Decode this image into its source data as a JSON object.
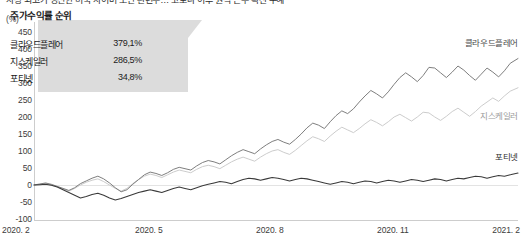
{
  "headline": {
    "text": "사상 최고가 경신한 미국 사이버 보안 관련주… 코로나 이후 원격 근무 확산 수혜"
  },
  "axis": {
    "unit_label": "(%)",
    "y_ticks": [
      450,
      400,
      350,
      300,
      250,
      200,
      150,
      100,
      50,
      0,
      -50,
      -100
    ],
    "x_ticks": [
      "2020. 2",
      "2020. 5",
      "2020. 8",
      "2020. 11",
      "2021. 2"
    ]
  },
  "callout": {
    "title": "주가수익률 순위",
    "rows": [
      {
        "name": "클라우드플레어",
        "value": "379,1%"
      },
      {
        "name": "지스케일러",
        "value": "286,5%"
      },
      {
        "name": "포티넷",
        "value": "34,8%"
      }
    ]
  },
  "series_labels": [
    {
      "name": "클라우드플레어"
    },
    {
      "name": "지스케일러"
    },
    {
      "name": "포티넷"
    }
  ],
  "colors": {
    "cloudflare": "#777777",
    "zscaler": "#c9c9c9",
    "fortinet": "#3a3a3a",
    "axis": "#cdcdcd",
    "zero": "#e3e3e3",
    "callout_bg": "#dcdcdc",
    "text": "#1b1b1b"
  },
  "chart_data": {
    "type": "line",
    "title": "사상 최고가 경신한 미국 사이버 보안 관련주… 코로나 이후 원격 근무 확산 수혜",
    "xlabel": "",
    "ylabel": "(%)",
    "ylim": [
      -100,
      450
    ],
    "ytick_step": 50,
    "grid": false,
    "legend": "inline-right",
    "x_tick_labels": [
      "2020. 2",
      "2020. 5",
      "2020. 8",
      "2020. 11",
      "2021. 2"
    ],
    "x_tick_positions": [
      0,
      0.25,
      0.5,
      0.75,
      1.0
    ],
    "note": "Cumulative stock return (%) rebased to 0 at 2020-02; x is fractional position 0..1 spanning 2020.2 to 2021.2",
    "series": [
      {
        "name": "클라우드플레어",
        "color": "#777777",
        "final_value": 379.1,
        "x": [
          0,
          0.012,
          0.024,
          0.036,
          0.048,
          0.06,
          0.072,
          0.084,
          0.096,
          0.108,
          0.12,
          0.132,
          0.144,
          0.156,
          0.168,
          0.18,
          0.192,
          0.204,
          0.216,
          0.228,
          0.24,
          0.252,
          0.264,
          0.276,
          0.288,
          0.3,
          0.312,
          0.324,
          0.336,
          0.348,
          0.36,
          0.372,
          0.384,
          0.396,
          0.408,
          0.42,
          0.432,
          0.444,
          0.456,
          0.468,
          0.48,
          0.492,
          0.504,
          0.516,
          0.528,
          0.54,
          0.552,
          0.564,
          0.576,
          0.588,
          0.6,
          0.612,
          0.624,
          0.636,
          0.648,
          0.66,
          0.672,
          0.684,
          0.696,
          0.708,
          0.72,
          0.732,
          0.744,
          0.756,
          0.768,
          0.78,
          0.792,
          0.804,
          0.816,
          0.828,
          0.84,
          0.852,
          0.864,
          0.876,
          0.888,
          0.9,
          0.912,
          0.924,
          0.936,
          0.948,
          0.96,
          0.972,
          0.984,
          1.0
        ],
        "values": [
          0,
          3,
          6,
          2,
          -4,
          -10,
          -16,
          -8,
          4,
          12,
          20,
          26,
          18,
          6,
          -8,
          -20,
          -14,
          2,
          16,
          30,
          38,
          34,
          28,
          36,
          46,
          52,
          48,
          44,
          56,
          66,
          72,
          68,
          62,
          74,
          86,
          96,
          104,
          98,
          92,
          106,
          118,
          128,
          134,
          126,
          120,
          134,
          150,
          168,
          182,
          176,
          166,
          186,
          204,
          218,
          210,
          224,
          244,
          262,
          278,
          268,
          256,
          274,
          296,
          316,
          330,
          318,
          304,
          322,
          346,
          344,
          330,
          316,
          332,
          350,
          338,
          322,
          308,
          326,
          344,
          332,
          318,
          336,
          358,
          372
        ]
      },
      {
        "name": "지스케일러",
        "color": "#c9c9c9",
        "final_value": 286.5,
        "x": [
          0,
          0.012,
          0.024,
          0.036,
          0.048,
          0.06,
          0.072,
          0.084,
          0.096,
          0.108,
          0.12,
          0.132,
          0.144,
          0.156,
          0.168,
          0.18,
          0.192,
          0.204,
          0.216,
          0.228,
          0.24,
          0.252,
          0.264,
          0.276,
          0.288,
          0.3,
          0.312,
          0.324,
          0.336,
          0.348,
          0.36,
          0.372,
          0.384,
          0.396,
          0.408,
          0.42,
          0.432,
          0.444,
          0.456,
          0.468,
          0.48,
          0.492,
          0.504,
          0.516,
          0.528,
          0.54,
          0.552,
          0.564,
          0.576,
          0.588,
          0.6,
          0.612,
          0.624,
          0.636,
          0.648,
          0.66,
          0.672,
          0.684,
          0.696,
          0.708,
          0.72,
          0.732,
          0.744,
          0.756,
          0.768,
          0.78,
          0.792,
          0.804,
          0.816,
          0.828,
          0.84,
          0.852,
          0.864,
          0.876,
          0.888,
          0.9,
          0.912,
          0.924,
          0.936,
          0.948,
          0.96,
          0.972,
          0.984,
          1.0
        ],
        "values": [
          0,
          2,
          4,
          0,
          -6,
          -12,
          -18,
          -10,
          0,
          8,
          14,
          18,
          10,
          0,
          -10,
          -18,
          -10,
          4,
          16,
          26,
          32,
          28,
          22,
          30,
          38,
          44,
          40,
          36,
          46,
          54,
          58,
          54,
          48,
          58,
          68,
          76,
          82,
          76,
          70,
          82,
          92,
          100,
          104,
          96,
          90,
          102,
          116,
          130,
          142,
          136,
          128,
          144,
          158,
          170,
          162,
          154,
          166,
          180,
          192,
          184,
          174,
          186,
          200,
          208,
          198,
          188,
          200,
          214,
          212,
          200,
          190,
          202,
          216,
          226,
          214,
          202,
          216,
          232,
          244,
          256,
          246,
          262,
          276,
          286
        ]
      },
      {
        "name": "포티넷",
        "color": "#3a3a3a",
        "final_value": 34.8,
        "x": [
          0,
          0.012,
          0.024,
          0.036,
          0.048,
          0.06,
          0.072,
          0.084,
          0.096,
          0.108,
          0.12,
          0.132,
          0.144,
          0.156,
          0.168,
          0.18,
          0.192,
          0.204,
          0.216,
          0.228,
          0.24,
          0.252,
          0.264,
          0.276,
          0.288,
          0.3,
          0.312,
          0.324,
          0.336,
          0.348,
          0.36,
          0.372,
          0.384,
          0.396,
          0.408,
          0.42,
          0.432,
          0.444,
          0.456,
          0.468,
          0.48,
          0.492,
          0.504,
          0.516,
          0.528,
          0.54,
          0.552,
          0.564,
          0.576,
          0.588,
          0.6,
          0.612,
          0.624,
          0.636,
          0.648,
          0.66,
          0.672,
          0.684,
          0.696,
          0.708,
          0.72,
          0.732,
          0.744,
          0.756,
          0.768,
          0.78,
          0.792,
          0.804,
          0.816,
          0.828,
          0.84,
          0.852,
          0.864,
          0.876,
          0.888,
          0.9,
          0.912,
          0.924,
          0.936,
          0.948,
          0.96,
          0.972,
          0.984,
          1.0
        ],
        "values": [
          0,
          1,
          2,
          -1,
          -6,
          -14,
          -22,
          -30,
          -38,
          -34,
          -28,
          -24,
          -30,
          -38,
          -44,
          -40,
          -34,
          -28,
          -22,
          -18,
          -14,
          -18,
          -22,
          -16,
          -10,
          -6,
          -10,
          -14,
          -8,
          -2,
          2,
          6,
          10,
          8,
          4,
          10,
          16,
          20,
          18,
          14,
          18,
          22,
          20,
          16,
          12,
          16,
          20,
          18,
          14,
          10,
          6,
          2,
          6,
          10,
          8,
          4,
          8,
          12,
          10,
          6,
          10,
          14,
          12,
          8,
          12,
          16,
          14,
          10,
          14,
          18,
          16,
          12,
          16,
          20,
          18,
          22,
          26,
          24,
          20,
          24,
          28,
          26,
          30,
          35
        ]
      }
    ]
  }
}
